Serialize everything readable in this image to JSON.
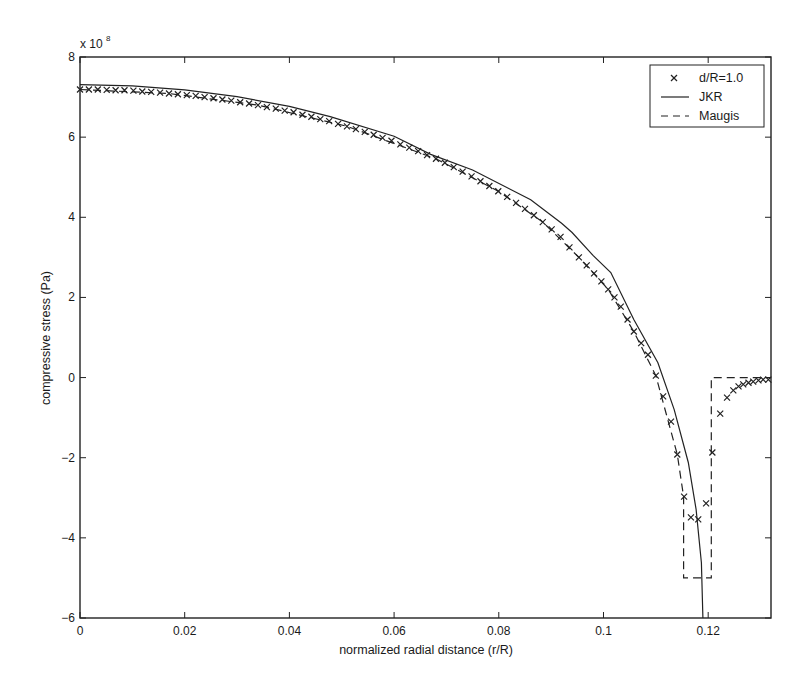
{
  "chart_data": {
    "type": "line",
    "title": "",
    "xlabel": "normalized radial distance (r/R)",
    "ylabel": "compressive stress (Pa)",
    "y_exponent_label": "x 10",
    "y_exponent": "8",
    "xlim": [
      0,
      0.132
    ],
    "ylim": [
      -6,
      8
    ],
    "y_scale_note": "values in units of 1e8 Pa",
    "grid": false,
    "legend_position": "upper right",
    "x_ticks": [
      0,
      0.02,
      0.04,
      0.06,
      0.08,
      0.1,
      0.12
    ],
    "x_tick_labels": [
      "0",
      "0.02",
      "0.04",
      "0.06",
      "0.08",
      "0.1",
      "0.12"
    ],
    "y_ticks": [
      -6,
      -4,
      -2,
      0,
      2,
      4,
      6,
      8
    ],
    "y_tick_labels": [
      "−6",
      "−4",
      "−2",
      "0",
      "2",
      "4",
      "6",
      "8"
    ],
    "series": [
      {
        "name": "d/R=1.0",
        "style": "markers",
        "marker": "x",
        "x": [
          0,
          0.0017,
          0.0034,
          0.0051,
          0.0068,
          0.0085,
          0.0102,
          0.0119,
          0.0136,
          0.0153,
          0.017,
          0.0187,
          0.0204,
          0.0221,
          0.0238,
          0.0255,
          0.0272,
          0.0289,
          0.0306,
          0.0323,
          0.034,
          0.0357,
          0.0374,
          0.0391,
          0.0408,
          0.0425,
          0.0442,
          0.0459,
          0.0476,
          0.0493,
          0.051,
          0.0527,
          0.0544,
          0.0561,
          0.0578,
          0.0595,
          0.0612,
          0.0629,
          0.0646,
          0.0663,
          0.068,
          0.0697,
          0.0714,
          0.0731,
          0.0748,
          0.0765,
          0.0782,
          0.0799,
          0.0816,
          0.0833,
          0.085,
          0.0867,
          0.0884,
          0.0901,
          0.0918,
          0.0935,
          0.0953,
          0.0968,
          0.0982,
          0.0996,
          0.1009,
          0.1021,
          0.1033,
          0.1046,
          0.1058,
          0.1072,
          0.1085,
          0.11,
          0.1114,
          0.1129,
          0.1141,
          0.1154,
          0.1167,
          0.1181,
          0.1196,
          0.1208,
          0.1223,
          0.1236,
          0.1248,
          0.1258,
          0.1267,
          0.1277,
          0.1286,
          0.1296,
          0.1305,
          0.1315
        ],
        "y": [
          7.19,
          7.19,
          7.19,
          7.18,
          7.17,
          7.17,
          7.16,
          7.14,
          7.13,
          7.11,
          7.09,
          7.07,
          7.05,
          7.03,
          7.0,
          6.97,
          6.94,
          6.91,
          6.87,
          6.84,
          6.8,
          6.75,
          6.71,
          6.66,
          6.62,
          6.56,
          6.51,
          6.45,
          6.4,
          6.33,
          6.27,
          6.2,
          6.13,
          6.06,
          5.98,
          5.91,
          5.82,
          5.74,
          5.65,
          5.55,
          5.46,
          5.36,
          5.25,
          5.14,
          5.02,
          4.9,
          4.78,
          4.65,
          4.51,
          4.36,
          4.21,
          4.05,
          3.88,
          3.7,
          3.51,
          3.25,
          3.0,
          2.8,
          2.6,
          2.4,
          2.2,
          2.0,
          1.77,
          1.45,
          1.15,
          0.86,
          0.57,
          0.05,
          -0.47,
          -1.1,
          -1.92,
          -2.97,
          -3.49,
          -3.54,
          -3.14,
          -1.87,
          -0.9,
          -0.5,
          -0.32,
          -0.22,
          -0.17,
          -0.13,
          -0.1,
          -0.07,
          -0.05,
          -0.05
        ]
      },
      {
        "name": "JKR",
        "style": "solid",
        "x": [
          0,
          0.01,
          0.02,
          0.03,
          0.04,
          0.0478,
          0.06,
          0.067,
          0.075,
          0.0861,
          0.092,
          0.094,
          0.098,
          0.1014,
          0.1058,
          0.1104,
          0.1135,
          0.1162,
          0.1177,
          0.1187,
          0.119
        ],
        "y": [
          7.31,
          7.28,
          7.18,
          7.01,
          6.77,
          6.51,
          6.02,
          5.57,
          5.18,
          4.44,
          3.85,
          3.62,
          3.05,
          2.62,
          1.45,
          0.37,
          -0.8,
          -2.12,
          -3.29,
          -4.62,
          -6.0
        ]
      },
      {
        "name": "Maugis",
        "style": "dashed",
        "x": [
          0,
          0.017,
          0.034,
          0.051,
          0.068,
          0.0799,
          0.0884,
          0.0953,
          0.1009,
          0.1058,
          0.11,
          0.1141,
          0.1153,
          0.1153,
          0.1206,
          0.1206,
          0.132
        ],
        "y": [
          7.19,
          7.09,
          6.8,
          6.27,
          5.46,
          4.65,
          3.88,
          3.0,
          2.2,
          1.15,
          0.05,
          -1.92,
          -2.97,
          -5.0,
          -5.0,
          0.0,
          0.0
        ]
      }
    ],
    "legend": [
      {
        "label": "d/R=1.0",
        "symbol": "x-marker"
      },
      {
        "label": "JKR",
        "symbol": "solid-line"
      },
      {
        "label": "Maugis",
        "symbol": "dashed-line"
      }
    ]
  }
}
